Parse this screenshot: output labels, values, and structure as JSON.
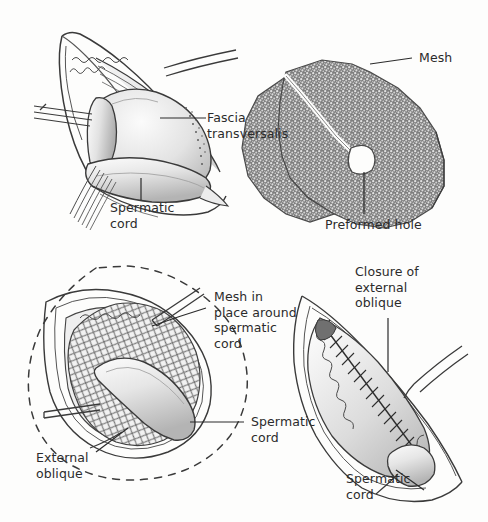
{
  "figure": {
    "background_color": "#fdfdfc",
    "ink_color": "#2b2b2b",
    "mesh_tone": "#8a8a8a",
    "tissue_tone": "#d9d9d9"
  },
  "panels": [
    {
      "id": "panel-top-left",
      "name": "fascia-transversalis-exposure",
      "position": "top-left",
      "labels": [
        "fascia_transversalis",
        "spermatic_cord_top"
      ]
    },
    {
      "id": "panel-top-right",
      "name": "mesh-with-preformed-hole",
      "position": "top-right",
      "labels": [
        "mesh",
        "preformed_hole"
      ]
    },
    {
      "id": "panel-bottom-left",
      "name": "mesh-in-place-around-cord",
      "position": "bottom-left",
      "labels": [
        "mesh_in_place",
        "spermatic_cord_bottom_left",
        "external_oblique"
      ]
    },
    {
      "id": "panel-bottom-right",
      "name": "closure-of-external-oblique",
      "position": "bottom-right",
      "labels": [
        "closure_of_external_oblique",
        "spermatic_cord_bottom_right"
      ]
    }
  ],
  "labels": {
    "fascia_transversalis": {
      "lines": [
        "Fascia",
        "transversalis"
      ],
      "text": "Fascia\ntransversalis"
    },
    "spermatic_cord_top": {
      "lines": [
        "Spermatic",
        "cord"
      ],
      "text": "Spermatic\ncord"
    },
    "mesh": {
      "lines": [
        "Mesh"
      ],
      "text": "Mesh"
    },
    "preformed_hole": {
      "lines": [
        "Preformed hole"
      ],
      "text": "Preformed hole"
    },
    "mesh_in_place": {
      "lines": [
        "Mesh in",
        "place around",
        "spermatic",
        "cord"
      ],
      "text": "Mesh in\nplace around\nspermatic\ncord"
    },
    "spermatic_cord_bottom_left": {
      "lines": [
        "Spermatic",
        "cord"
      ],
      "text": "Spermatic\ncord"
    },
    "external_oblique": {
      "lines": [
        "External",
        "oblique"
      ],
      "text": "External\noblique"
    },
    "closure_of_external_oblique": {
      "lines": [
        "Closure of",
        "external",
        "oblique"
      ],
      "text": "Closure of\nexternal\noblique"
    },
    "spermatic_cord_bottom_right": {
      "lines": [
        "Spermatic",
        "cord"
      ],
      "text": "Spermatic\ncord"
    }
  }
}
